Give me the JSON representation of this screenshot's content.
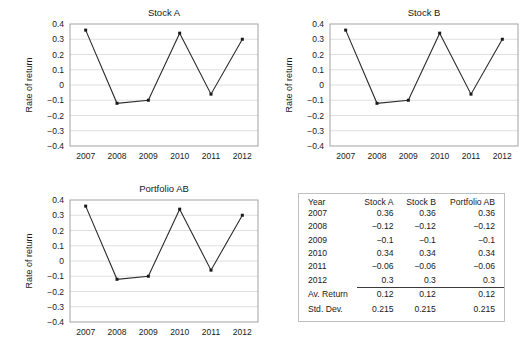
{
  "chart_data": [
    {
      "type": "line",
      "name": "stock-a",
      "title": "Stock A",
      "xlabel": "",
      "ylabel": "Rate of return",
      "categories": [
        "2007",
        "2008",
        "2009",
        "2010",
        "2011",
        "2012"
      ],
      "values": [
        0.36,
        -0.12,
        -0.1,
        0.34,
        -0.06,
        0.3
      ],
      "ylim": [
        -0.4,
        0.4
      ],
      "yticks": [
        "0.4",
        "0.3",
        "0.2",
        "0.1",
        "0",
        "−0.1",
        "−0.2",
        "−0.3",
        "−0.4"
      ],
      "ytick_values": [
        0.4,
        0.3,
        0.2,
        0.1,
        0,
        -0.1,
        -0.2,
        -0.3,
        -0.4
      ],
      "grid": "horizontal",
      "legend": "none",
      "marker": "square",
      "line_color": "#2b2b2b"
    },
    {
      "type": "line",
      "name": "stock-b",
      "title": "Stock B",
      "xlabel": "",
      "ylabel": "Rate of return",
      "categories": [
        "2007",
        "2008",
        "2009",
        "2010",
        "2011",
        "2012"
      ],
      "values": [
        0.36,
        -0.12,
        -0.1,
        0.34,
        -0.06,
        0.3
      ],
      "ylim": [
        -0.4,
        0.4
      ],
      "yticks": [
        "0.4",
        "0.3",
        "0.2",
        "0.1",
        "0",
        "−0.1",
        "−0.2",
        "−0.3",
        "−0.4"
      ],
      "ytick_values": [
        0.4,
        0.3,
        0.2,
        0.1,
        0,
        -0.1,
        -0.2,
        -0.3,
        -0.4
      ],
      "grid": "horizontal",
      "legend": "none",
      "marker": "square",
      "line_color": "#2b2b2b"
    },
    {
      "type": "line",
      "name": "portfolio-ab",
      "title": "Portfolio AB",
      "xlabel": "",
      "ylabel": "Rate of return",
      "categories": [
        "2007",
        "2008",
        "2009",
        "2010",
        "2011",
        "2012"
      ],
      "values": [
        0.36,
        -0.12,
        -0.1,
        0.34,
        -0.06,
        0.3
      ],
      "ylim": [
        -0.4,
        0.4
      ],
      "yticks": [
        "0.4",
        "0.3",
        "0.2",
        "0.1",
        "0",
        "−0.1",
        "−0.2",
        "−0.3",
        "−0.4"
      ],
      "ytick_values": [
        0.4,
        0.3,
        0.2,
        0.1,
        0,
        -0.1,
        -0.2,
        -0.3,
        -0.4
      ],
      "grid": "horizontal",
      "legend": "none",
      "marker": "square",
      "line_color": "#2b2b2b"
    }
  ],
  "table": {
    "headers": [
      "Year",
      "Stock A",
      "Stock B",
      "Portfolio AB"
    ],
    "rows": [
      [
        "2007",
        "0.36",
        "0.36",
        "0.36"
      ],
      [
        "2008",
        "−0.12",
        "−0.12",
        "−0.12"
      ],
      [
        "2009",
        "−0.1",
        "−0.1",
        "−0.1"
      ],
      [
        "2010",
        "0.34",
        "0.34",
        "0.34"
      ],
      [
        "2011",
        "−0.06",
        "−0.06",
        "−0.06"
      ],
      [
        "2012",
        "0.3",
        "0.3",
        "0.3"
      ]
    ],
    "summary": [
      [
        "Av. Return",
        "0.12",
        "0.12",
        "0.12"
      ],
      [
        "Std. Dev.",
        "0.215",
        "0.215",
        "0.215"
      ]
    ]
  }
}
